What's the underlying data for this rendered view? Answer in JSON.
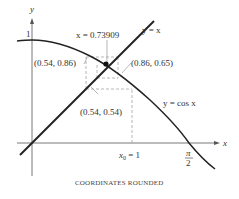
{
  "diagram": {
    "axes": {
      "x_label": "x",
      "y_label": "y",
      "y_tick_label": "1"
    },
    "curves": {
      "line_label": "y = x",
      "cos_label": "y = cos x"
    },
    "fixed_point_label": "x = 0.73909",
    "points": [
      {
        "label": "(0.54, 0.86)"
      },
      {
        "label": "(0.86, 0.65)"
      },
      {
        "label": "(0.54, 0.54)"
      }
    ],
    "x_ticks": {
      "x0_label_var": "x",
      "x0_label_sub": "0",
      "x0_label_rest": " = 1",
      "pi_num": "π",
      "pi_den": "2"
    },
    "caption": "COORDINATES ROUNDED"
  },
  "colors": {
    "curve": "#222222",
    "dashed": "#999999",
    "text": "#333333"
  }
}
